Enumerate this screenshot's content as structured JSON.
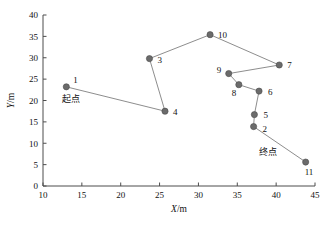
{
  "chart_data": {
    "type": "scatter",
    "title": "",
    "xlabel": "X/m",
    "ylabel": "Y/m",
    "xlim": [
      10,
      45
    ],
    "ylim": [
      0,
      40
    ],
    "xticks": [
      10,
      15,
      20,
      25,
      30,
      35,
      40,
      45
    ],
    "yticks": [
      0,
      5,
      10,
      15,
      20,
      25,
      30,
      35,
      40
    ],
    "grid": false,
    "legend": "none",
    "connected_path": true,
    "path_order": [
      "1",
      "4",
      "3",
      "10",
      "7",
      "9",
      "8",
      "6",
      "5",
      "2",
      "11"
    ],
    "points": [
      {
        "label": "1",
        "x": 13.0,
        "y": 23.2,
        "label_dx": 7,
        "label_dy": -4
      },
      {
        "label": "4",
        "x": 25.7,
        "y": 17.5,
        "label_dx": 8,
        "label_dy": 4
      },
      {
        "label": "3",
        "x": 23.7,
        "y": 29.8,
        "label_dx": 8,
        "label_dy": 4
      },
      {
        "label": "10",
        "x": 31.5,
        "y": 35.4,
        "label_dx": 8,
        "label_dy": 3
      },
      {
        "label": "7",
        "x": 40.4,
        "y": 28.3,
        "label_dx": 8,
        "label_dy": 3
      },
      {
        "label": "9",
        "x": 33.9,
        "y": 26.3,
        "label_dx": -12,
        "label_dy": -1
      },
      {
        "label": "8",
        "x": 35.2,
        "y": 23.7,
        "label_dx": -7,
        "label_dy": 11
      },
      {
        "label": "6",
        "x": 37.8,
        "y": 22.2,
        "label_dx": 9,
        "label_dy": 4
      },
      {
        "label": "5",
        "x": 37.2,
        "y": 16.7,
        "label_dx": 9,
        "label_dy": 3
      },
      {
        "label": "2",
        "x": 37.1,
        "y": 13.9,
        "label_dx": 9,
        "label_dy": 5
      },
      {
        "label": "11",
        "x": 43.8,
        "y": 5.6,
        "label_dx": -1,
        "label_dy": 13
      }
    ],
    "annotations": [
      {
        "text": "起点",
        "x": 13.6,
        "y": 19.6,
        "name": "start-point-annotation"
      },
      {
        "text": "终点",
        "x": 39.0,
        "y": 7.3,
        "name": "end-point-annotation"
      }
    ],
    "marker_color": "#6b6b6b",
    "line_color": "#808080"
  }
}
